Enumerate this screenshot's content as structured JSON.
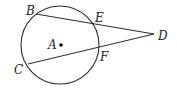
{
  "diagram": {
    "type": "geometry",
    "colors": {
      "stroke": "#2a2a2a",
      "label": "#222222",
      "background": "#ffffff"
    },
    "circle": {
      "center_label": "A",
      "cx": 60,
      "cy": 45,
      "r": 39
    },
    "points": {
      "A": {
        "label": "A",
        "x": 60,
        "y": 45
      },
      "B": {
        "label": "B",
        "x": 36,
        "y": 14
      },
      "C": {
        "label": "C",
        "x": 28,
        "y": 64
      },
      "D": {
        "label": "D",
        "x": 154,
        "y": 34
      },
      "E": {
        "label": "E",
        "x": 93,
        "y": 22
      },
      "F": {
        "label": "F",
        "x": 98,
        "y": 49
      }
    },
    "segments": [
      {
        "name": "BD",
        "from": "B",
        "to": "D"
      },
      {
        "name": "CD",
        "from": "C",
        "to": "D"
      }
    ]
  }
}
